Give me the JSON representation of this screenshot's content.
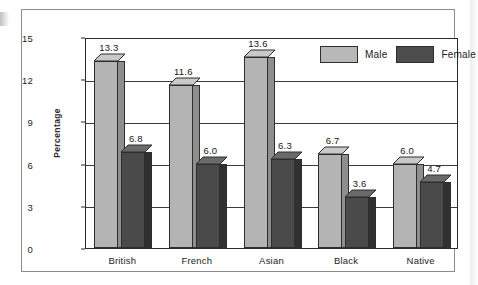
{
  "chart_data": {
    "type": "bar",
    "title": "",
    "subtitle": "",
    "xlabel": "",
    "ylabel": "Percentage",
    "categories": [
      "British",
      "French",
      "Asian",
      "Black",
      "Native"
    ],
    "series": [
      {
        "name": "Male",
        "color": "#b4b4b4",
        "values": [
          13.3,
          11.6,
          13.6,
          6.7,
          6.0
        ]
      },
      {
        "name": "Female",
        "color": "#4a4a4a",
        "values": [
          6.8,
          6.0,
          6.3,
          3.6,
          4.7
        ]
      }
    ],
    "value_labels": {
      "British": {
        "Male": "13.3",
        "Female": "6.8"
      },
      "French": {
        "Male": "11.6",
        "Female": "6.0"
      },
      "Asian": {
        "Male": "13.6",
        "Female": "6.3"
      },
      "Black": {
        "Male": "6.7",
        "Female": "3.6"
      },
      "Native": {
        "Male": "6.0",
        "Female": "4.7"
      }
    },
    "ylim": [
      0,
      15
    ],
    "yticks": [
      "0",
      "3",
      "6",
      "9",
      "12",
      "15"
    ],
    "ytick_values": [
      0,
      3,
      6,
      9,
      12,
      15
    ],
    "grid": true,
    "grid_axis": "y",
    "legend_position": "top-right",
    "style": "3d-bar"
  },
  "legend": {
    "items": [
      {
        "label": "Male",
        "swatch": "male-swatch"
      },
      {
        "label": "Female",
        "swatch": "female-swatch"
      }
    ]
  },
  "axis": {
    "y_title": "Percentage",
    "y_ticks": [
      "15",
      "12",
      "9",
      "6",
      "3",
      "0"
    ]
  },
  "categories": [
    "British",
    "French",
    "Asian",
    "Black",
    "Native"
  ],
  "values": {
    "british_male": "13.3",
    "british_female": "6.8",
    "french_male": "11.6",
    "french_female": "6.0",
    "asian_male": "13.6",
    "asian_female": "6.3",
    "black_male": "6.7",
    "black_female": "3.6",
    "native_male": "6.0",
    "native_female": "4.7"
  }
}
